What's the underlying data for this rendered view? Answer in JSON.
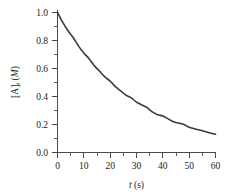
{
  "chart_data": {
    "type": "line",
    "title": "",
    "subtitle": "",
    "xlabel": "t (s)",
    "xlabel_italic_part": "t",
    "xlabel_unit_part": " (s)",
    "ylabel": "[A]t (M)",
    "ylabel_bracket_part": "[A]",
    "ylabel_subscript_part": "t",
    "ylabel_unit_part": " (M)",
    "xlim": [
      0,
      60
    ],
    "ylim": [
      0.0,
      1.0
    ],
    "xticks": [
      0,
      10,
      20,
      30,
      40,
      50,
      60
    ],
    "xtick_labels": [
      "0",
      "10",
      "20",
      "30",
      "40",
      "50",
      "60"
    ],
    "yticks": [
      0.0,
      0.2,
      0.4,
      0.6,
      0.8,
      1.0
    ],
    "ytick_labels": [
      "0.0",
      "0.2",
      "0.4",
      "0.6",
      "0.8",
      "1.0"
    ],
    "x_minor_interval": 5,
    "y_minor_interval": 0.1,
    "grid": false,
    "legend": false,
    "legend_position": "none",
    "curve_color": "#3a3a3a",
    "axis_color": "#4a4a4a",
    "background_color": "#ffffff",
    "series": [
      {
        "name": "[A]t",
        "x": [
          0,
          2,
          4,
          6,
          8,
          10,
          12,
          14,
          16,
          18,
          20,
          22,
          24,
          26,
          28,
          30,
          32,
          34,
          36,
          38,
          40,
          42,
          44,
          46,
          48,
          50,
          52,
          54,
          56,
          58,
          60
        ],
        "values": [
          1.0,
          0.93,
          0.87,
          0.82,
          0.76,
          0.71,
          0.67,
          0.62,
          0.58,
          0.54,
          0.51,
          0.47,
          0.44,
          0.41,
          0.39,
          0.36,
          0.34,
          0.32,
          0.29,
          0.27,
          0.26,
          0.24,
          0.22,
          0.21,
          0.2,
          0.18,
          0.17,
          0.16,
          0.15,
          0.14,
          0.13
        ]
      }
    ]
  }
}
